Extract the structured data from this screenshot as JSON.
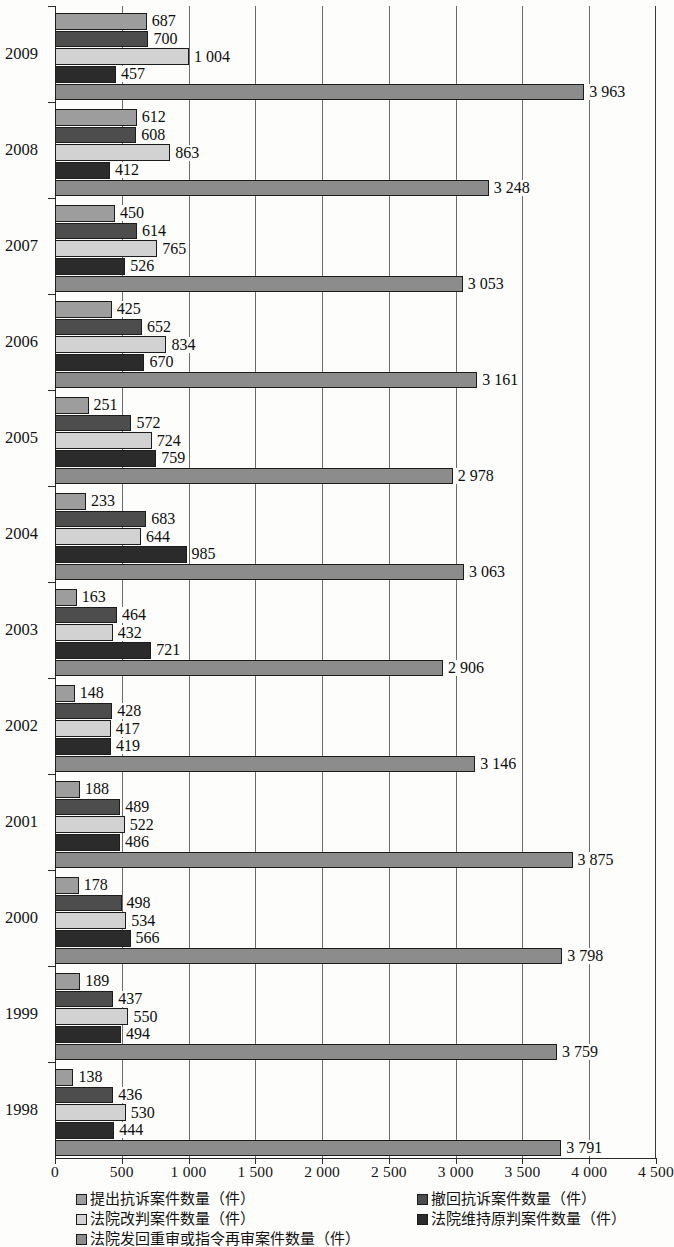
{
  "chart_data": {
    "type": "bar",
    "orientation": "horizontal",
    "title": "",
    "xlabel": "",
    "ylabel": "",
    "xlim": [
      0,
      4500
    ],
    "xticks": [
      0,
      500,
      1000,
      1500,
      2000,
      2500,
      3000,
      3500,
      4000,
      4500
    ],
    "xtick_labels": [
      "0",
      "500",
      "1 000",
      "1 500",
      "2 000",
      "2 500",
      "3 000",
      "3 500",
      "4 000",
      "4 500"
    ],
    "grid": "vertical",
    "legend_position": "bottom",
    "categories": [
      "2009",
      "2008",
      "2007",
      "2006",
      "2005",
      "2004",
      "2003",
      "2002",
      "2001",
      "2000",
      "1999",
      "1998"
    ],
    "series": [
      {
        "name": "提出抗诉案件数量（件）",
        "color": "#9d9d9d",
        "values": [
          687,
          612,
          450,
          425,
          251,
          233,
          163,
          148,
          188,
          178,
          189,
          138
        ],
        "labels": [
          "687",
          "612",
          "450",
          "425",
          "251",
          "233",
          "163",
          "148",
          "188",
          "178",
          "189",
          "138"
        ]
      },
      {
        "name": "撤回抗诉案件数量（件）",
        "color": "#4d4d4d",
        "values": [
          700,
          608,
          614,
          652,
          572,
          683,
          464,
          428,
          489,
          498,
          437,
          436
        ],
        "labels": [
          "700",
          "608",
          "614",
          "652",
          "572",
          "683",
          "464",
          "428",
          "489",
          "498",
          "437",
          "436"
        ]
      },
      {
        "name": "法院改判案件数量（件）",
        "color": "#d2d2d2",
        "values": [
          1004,
          863,
          765,
          834,
          724,
          644,
          432,
          417,
          522,
          534,
          550,
          530
        ],
        "labels": [
          "1 004",
          "863",
          "765",
          "834",
          "724",
          "644",
          "432",
          "417",
          "522",
          "534",
          "550",
          "530"
        ]
      },
      {
        "name": "法院维持原判案件数量（件）",
        "color": "#2b2b2b",
        "values": [
          457,
          412,
          526,
          670,
          759,
          985,
          721,
          419,
          486,
          566,
          494,
          444
        ],
        "labels": [
          "457",
          "412",
          "526",
          "670",
          "759",
          "985",
          "721",
          "419",
          "486",
          "566",
          "494",
          "444"
        ]
      },
      {
        "name": "法院发回重审或指令再审案件数量（件）",
        "color": "#8c8c8c",
        "values": [
          3963,
          3248,
          3053,
          3161,
          2978,
          3063,
          2906,
          3146,
          3875,
          3798,
          3759,
          3791
        ],
        "labels": [
          "3 963",
          "3 248",
          "3 053",
          "3 161",
          "2 978",
          "3 063",
          "2 906",
          "3 146",
          "3 875",
          "3 798",
          "3 759",
          "3 791"
        ]
      }
    ]
  },
  "legend": {
    "entries": [
      {
        "label": "提出抗诉案件数量（件）",
        "swatch": "s0",
        "column": "left",
        "row": 0
      },
      {
        "label": "法院改判案件数量（件）",
        "swatch": "s2",
        "column": "left",
        "row": 1
      },
      {
        "label": "法院发回重审或指令再审案件数量（件）",
        "swatch": "s4",
        "column": "left",
        "row": 2
      },
      {
        "label": "撤回抗诉案件数量（件）",
        "swatch": "s1",
        "column": "right",
        "row": 0
      },
      {
        "label": "法院维持原判案件数量（件）",
        "swatch": "s3",
        "column": "right",
        "row": 1
      }
    ]
  }
}
